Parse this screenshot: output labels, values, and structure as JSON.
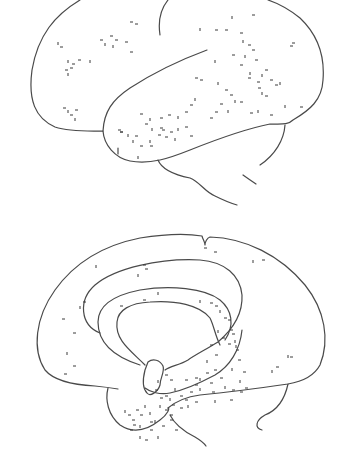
{
  "figure": {
    "views": [
      {
        "id": "lateral",
        "description": "lateral view of brain hemisphere with scattered stipple marks, dense along superior temporal region"
      },
      {
        "id": "medial",
        "description": "medial view of brain hemisphere with dense stipple in cingulate / parahippocampal limbic region"
      }
    ],
    "colors": {
      "line": "#4a4a4a",
      "stipple": "#3a3a3a",
      "background": "#ffffff"
    },
    "stipple": {
      "lateral": [
        [
          58,
          42
        ],
        [
          60,
          47
        ],
        [
          100,
          40
        ],
        [
          105,
          43
        ],
        [
          110,
          36
        ],
        [
          115,
          40
        ],
        [
          113,
          45
        ],
        [
          125,
          42
        ],
        [
          130,
          52
        ],
        [
          68,
          60
        ],
        [
          72,
          64
        ],
        [
          78,
          60
        ],
        [
          90,
          60
        ],
        [
          65,
          70
        ],
        [
          70,
          68
        ],
        [
          68,
          73
        ],
        [
          130,
          22
        ],
        [
          135,
          24
        ],
        [
          200,
          28
        ],
        [
          215,
          30
        ],
        [
          225,
          30
        ],
        [
          232,
          16
        ],
        [
          252,
          15
        ],
        [
          240,
          33
        ],
        [
          243,
          40
        ],
        [
          248,
          45
        ],
        [
          252,
          50
        ],
        [
          245,
          55
        ],
        [
          255,
          60
        ],
        [
          240,
          65
        ],
        [
          250,
          72
        ],
        [
          248,
          78
        ],
        [
          257,
          82
        ],
        [
          262,
          74
        ],
        [
          265,
          70
        ],
        [
          258,
          88
        ],
        [
          262,
          92
        ],
        [
          270,
          80
        ],
        [
          275,
          85
        ],
        [
          280,
          82
        ],
        [
          265,
          96
        ],
        [
          232,
          55
        ],
        [
          215,
          60
        ],
        [
          195,
          78
        ],
        [
          200,
          80
        ],
        [
          218,
          82
        ],
        [
          225,
          90
        ],
        [
          230,
          95
        ],
        [
          235,
          100
        ],
        [
          240,
          102
        ],
        [
          220,
          104
        ],
        [
          228,
          110
        ],
        [
          215,
          112
        ],
        [
          210,
          118
        ],
        [
          195,
          98
        ],
        [
          190,
          105
        ],
        [
          185,
          112
        ],
        [
          178,
          116
        ],
        [
          168,
          115
        ],
        [
          160,
          118
        ],
        [
          150,
          118
        ],
        [
          140,
          114
        ],
        [
          145,
          124
        ],
        [
          152,
          128
        ],
        [
          162,
          130
        ],
        [
          170,
          132
        ],
        [
          178,
          128
        ],
        [
          185,
          127
        ],
        [
          190,
          136
        ],
        [
          175,
          138
        ],
        [
          165,
          137
        ],
        [
          158,
          135
        ],
        [
          150,
          140
        ],
        [
          160,
          128
        ],
        [
          120,
          132
        ],
        [
          128,
          134
        ],
        [
          135,
          136
        ],
        [
          118,
          130
        ],
        [
          133,
          140
        ],
        [
          140,
          146
        ],
        [
          150,
          146
        ],
        [
          138,
          156
        ],
        [
          120,
          132
        ],
        [
          63,
          108
        ],
        [
          68,
          110
        ],
        [
          75,
          110
        ],
        [
          70,
          115
        ],
        [
          75,
          118
        ],
        [
          292,
          43
        ],
        [
          290,
          46
        ],
        [
          285,
          105
        ],
        [
          270,
          115
        ],
        [
          250,
          113
        ],
        [
          258,
          110
        ],
        [
          300,
          107
        ]
      ],
      "medial": [
        [
          96,
          265
        ],
        [
          143,
          265
        ],
        [
          145,
          269
        ],
        [
          138,
          274
        ],
        [
          204,
          248
        ],
        [
          214,
          252
        ],
        [
          253,
          260
        ],
        [
          262,
          260
        ],
        [
          83,
          302
        ],
        [
          80,
          306
        ],
        [
          62,
          319
        ],
        [
          73,
          333
        ],
        [
          67,
          352
        ],
        [
          73,
          366
        ],
        [
          64,
          374
        ],
        [
          158,
          292
        ],
        [
          143,
          300
        ],
        [
          120,
          306
        ],
        [
          200,
          300
        ],
        [
          210,
          303
        ],
        [
          215,
          306
        ],
        [
          220,
          310
        ],
        [
          224,
          318
        ],
        [
          230,
          330
        ],
        [
          235,
          340
        ],
        [
          236,
          350
        ],
        [
          238,
          360
        ],
        [
          232,
          368
        ],
        [
          220,
          378
        ],
        [
          210,
          383
        ],
        [
          200,
          388
        ],
        [
          190,
          392
        ],
        [
          180,
          396
        ],
        [
          170,
          398
        ],
        [
          160,
          398
        ],
        [
          155,
          390
        ],
        [
          158,
          380
        ],
        [
          165,
          375
        ],
        [
          170,
          380
        ],
        [
          175,
          388
        ],
        [
          185,
          380
        ],
        [
          195,
          378
        ],
        [
          160,
          405
        ],
        [
          165,
          410
        ],
        [
          170,
          415
        ],
        [
          150,
          412
        ],
        [
          140,
          415
        ],
        [
          132,
          420
        ],
        [
          140,
          425
        ],
        [
          150,
          430
        ],
        [
          130,
          430
        ],
        [
          140,
          436
        ],
        [
          150,
          422
        ],
        [
          170,
          420
        ],
        [
          200,
          378
        ],
        [
          206,
          373
        ],
        [
          214,
          370
        ],
        [
          225,
          386
        ],
        [
          232,
          390
        ],
        [
          240,
          392
        ],
        [
          240,
          380
        ],
        [
          243,
          372
        ],
        [
          212,
          392
        ],
        [
          215,
          400
        ],
        [
          230,
          400
        ],
        [
          245,
          388
        ],
        [
          288,
          355
        ],
        [
          290,
          357
        ],
        [
          276,
          367
        ],
        [
          272,
          370
        ],
        [
          228,
          344
        ],
        [
          222,
          338
        ],
        [
          218,
          330
        ],
        [
          228,
          320
        ],
        [
          232,
          334
        ],
        [
          236,
          345
        ],
        [
          172,
          405
        ],
        [
          180,
          408
        ],
        [
          188,
          405
        ],
        [
          195,
          402
        ],
        [
          165,
          396
        ],
        [
          125,
          410
        ],
        [
          128,
          415
        ],
        [
          136,
          410
        ],
        [
          145,
          405
        ],
        [
          133,
          425
        ],
        [
          145,
          440
        ],
        [
          158,
          436
        ],
        [
          175,
          430
        ],
        [
          162,
          426
        ],
        [
          155,
          420
        ],
        [
          210,
          345
        ],
        [
          215,
          355
        ],
        [
          207,
          360
        ],
        [
          195,
          385
        ],
        [
          185,
          400
        ]
      ]
    }
  }
}
